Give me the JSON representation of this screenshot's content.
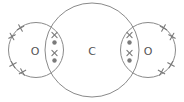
{
  "diagram": {
    "atoms": [
      {
        "id": "oxygen-left",
        "symbol": "O"
      },
      {
        "id": "carbon",
        "symbol": "C"
      },
      {
        "id": "oxygen-right",
        "symbol": "O"
      }
    ],
    "electron_symbols": {
      "oxygen": "cross",
      "carbon": "dot"
    },
    "bonds": [
      {
        "between": [
          "oxygen-left",
          "carbon"
        ],
        "type": "double",
        "shared_electrons": [
          "cross",
          "dot",
          "cross",
          "dot"
        ]
      },
      {
        "between": [
          "carbon",
          "oxygen-right"
        ],
        "type": "double",
        "shared_electrons": [
          "cross",
          "dot",
          "cross",
          "dot"
        ]
      }
    ],
    "lone_pairs": {
      "oxygen-left": 2,
      "oxygen-right": 2
    },
    "colors": {
      "line": "#8a8a8a",
      "marker": "#7a7a7a",
      "text": "#555555"
    }
  }
}
